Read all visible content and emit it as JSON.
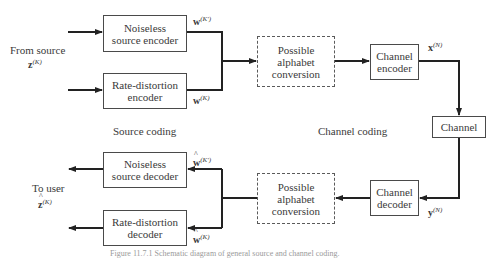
{
  "diagram": {
    "inputs": {
      "from_source_label": "From source",
      "from_source_symbol": "z",
      "from_source_sup": "(K)",
      "to_user_label": "To user",
      "to_user_symbol": "z",
      "to_user_sup": "(K)"
    },
    "encoders": {
      "noiseless": "Noiseless source encoder",
      "rate_distortion": "Rate-distortion encoder",
      "w_noiseless_symbol": "w",
      "w_noiseless_sup": "(K')",
      "w_rd_symbol": "w",
      "w_rd_sup": "(K)"
    },
    "conversion_top": "Possible alphabet conversion",
    "channel_encoder": "Channel encoder",
    "x_symbol": "x",
    "x_sup": "(N)",
    "channel": "Channel",
    "channel_decoder": "Channel decoder",
    "y_symbol": "y",
    "y_sup": "(N)",
    "conversion_bottom": "Possible alphabet conversion",
    "decoders": {
      "noiseless": "Noiseless source decoder",
      "rate_distortion": "Rate-distortion decoder",
      "w_noiseless_symbol": "w",
      "w_noiseless_sup": "(K')",
      "w_rd_symbol": "w",
      "w_rd_sup": "(K)"
    },
    "section_labels": {
      "source_coding": "Source coding",
      "channel_coding": "Channel coding"
    },
    "caption": "Figure 11.7.1   Schematic diagram of general source and channel coding."
  }
}
